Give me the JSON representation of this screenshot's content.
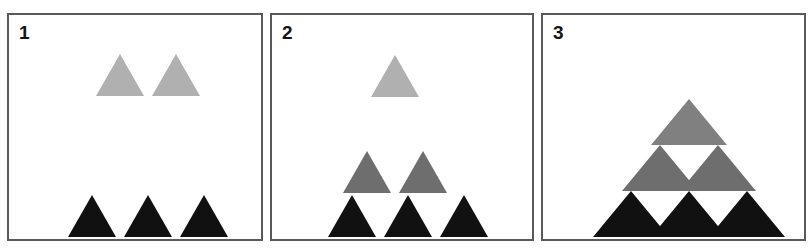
{
  "figure": {
    "kind": "triangle-growth-sequence",
    "background": "#ffffff",
    "border_color": "#5a5a5a",
    "width": 811,
    "height": 252
  },
  "colors": {
    "black": "#111111",
    "mid_gray": "#6e6e6e",
    "light_gray": "#b0b0b0",
    "panel_top_gray": "#808080",
    "border": "#5a5a5a",
    "label_text": "#141414"
  },
  "panels": [
    {
      "label": "1",
      "name": "panel-one",
      "description": "Bottom row of three black triangles with two light gray triangles floating above",
      "rows": [
        {
          "name": "top-row",
          "count": 2,
          "color": "#b0b0b0",
          "tone": "light-gray",
          "attached": false
        },
        {
          "name": "base-row",
          "count": 3,
          "color": "#111111",
          "tone": "black",
          "attached": false
        }
      ],
      "total_triangles": 5
    },
    {
      "label": "2",
      "name": "panel-two",
      "description": "Three black triangles, two mid gray triangles resting above them, and one light gray triangle floating higher",
      "rows": [
        {
          "name": "apex-row",
          "count": 1,
          "color": "#b0b0b0",
          "tone": "light-gray",
          "attached": false
        },
        {
          "name": "middle-row",
          "count": 2,
          "color": "#6e6e6e",
          "tone": "mid-gray",
          "attached": true
        },
        {
          "name": "base-row",
          "count": 3,
          "color": "#111111",
          "tone": "black",
          "attached": true
        }
      ],
      "total_triangles": 6
    },
    {
      "label": "3",
      "name": "panel-three",
      "description": "Completed stacked pyramid of six triangles in three tiers",
      "rows": [
        {
          "name": "apex-row",
          "count": 1,
          "color": "#808080",
          "tone": "gray",
          "attached": true
        },
        {
          "name": "middle-row",
          "count": 2,
          "color": "#6e6e6e",
          "tone": "mid-gray",
          "attached": true
        },
        {
          "name": "base-row",
          "count": 3,
          "color": "#111111",
          "tone": "black",
          "attached": true
        }
      ],
      "total_triangles": 6
    }
  ],
  "geometry": {
    "panel1": {
      "base": {
        "y_base": 222,
        "half_width": 24,
        "height": 42,
        "centers": [
          83,
          139,
          195
        ]
      },
      "top": {
        "y_base": 81,
        "half_width": 24,
        "height": 42,
        "centers": [
          111,
          167
        ]
      }
    },
    "panel2": {
      "base": {
        "y_base": 222,
        "half_width": 24,
        "height": 42,
        "centers": [
          80,
          136,
          192
        ]
      },
      "middle": {
        "y_base": 178,
        "half_width": 24,
        "height": 42,
        "centers": [
          95,
          151
        ]
      },
      "apex": {
        "y_base": 82,
        "half_width": 24,
        "height": 42,
        "centers": [
          123
        ]
      }
    },
    "panel3": {
      "base": {
        "y_base": 222,
        "half_width": 38,
        "height": 46,
        "centers": [
          88,
          146,
          204
        ]
      },
      "middle": {
        "y_base": 176,
        "half_width": 38,
        "height": 46,
        "centers": [
          117,
          175
        ]
      },
      "apex": {
        "y_base": 130,
        "half_width": 38,
        "height": 46,
        "centers": [
          146
        ]
      }
    }
  }
}
